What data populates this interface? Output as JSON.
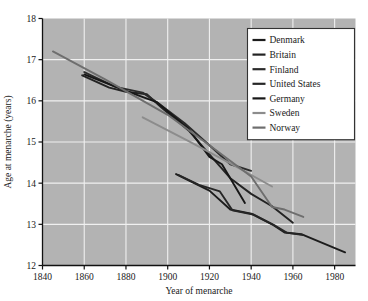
{
  "chart_data": {
    "type": "line",
    "title": "",
    "xlabel": "Year of menarche",
    "ylabel": "Age at menarche (years)",
    "xlim": [
      1840,
      1990
    ],
    "ylim": [
      12,
      18
    ],
    "xticks": [
      1840,
      1860,
      1880,
      1900,
      1920,
      1940,
      1960,
      1980
    ],
    "yticks": [
      12,
      13,
      14,
      15,
      16,
      17,
      18
    ],
    "grid": true,
    "legend_position": "top-right",
    "background_color": "#b3b3b3",
    "grid_color": "#f0f0f0",
    "series": [
      {
        "name": "Denmark",
        "color": "#1c1c1c",
        "points": [
          [
            1904,
            14.22
          ],
          [
            1912,
            14.02
          ],
          [
            1920,
            13.82
          ],
          [
            1930,
            13.36
          ],
          [
            1940,
            13.26
          ],
          [
            1950,
            13.0
          ],
          [
            1956,
            12.8
          ],
          [
            1964,
            12.76
          ],
          [
            1985,
            12.32
          ]
        ]
      },
      {
        "name": "Britain",
        "color": "#232323",
        "points": [
          [
            1859,
            16.62
          ],
          [
            1872,
            16.32
          ],
          [
            1880,
            16.22
          ],
          [
            1890,
            16.16
          ],
          [
            1897,
            15.84
          ],
          [
            1910,
            15.28
          ],
          [
            1920,
            14.7
          ],
          [
            1930,
            14.12
          ],
          [
            1940,
            13.74
          ],
          [
            1950,
            13.44
          ],
          [
            1960,
            13.04
          ]
        ]
      },
      {
        "name": "Finland",
        "color": "#2b2b2b",
        "points": [
          [
            1860,
            16.7
          ],
          [
            1875,
            16.34
          ],
          [
            1888,
            16.2
          ],
          [
            1896,
            15.92
          ],
          [
            1908,
            15.46
          ],
          [
            1920,
            14.92
          ],
          [
            1930,
            14.46
          ],
          [
            1940,
            14.3
          ]
        ]
      },
      {
        "name": "United States",
        "color": "#262626",
        "points": [
          [
            1905,
            14.2
          ],
          [
            1915,
            13.96
          ],
          [
            1925,
            13.8
          ],
          [
            1931,
            13.34
          ],
          [
            1941,
            13.24
          ],
          [
            1951,
            12.98
          ],
          [
            1957,
            12.8
          ],
          [
            1965,
            12.74
          ]
        ]
      },
      {
        "name": "Germany",
        "color": "#171717",
        "points": [
          [
            1860,
            16.64
          ],
          [
            1880,
            16.24
          ],
          [
            1895,
            15.96
          ],
          [
            1910,
            15.32
          ],
          [
            1920,
            14.64
          ],
          [
            1926,
            14.46
          ],
          [
            1937,
            13.52
          ]
        ]
      },
      {
        "name": "Sweden",
        "color": "#8c8c8c",
        "points": [
          [
            1888,
            15.6
          ],
          [
            1910,
            15.02
          ],
          [
            1930,
            14.48
          ],
          [
            1950,
            13.92
          ]
        ]
      },
      {
        "name": "Norway",
        "color": "#6e6e6e",
        "points": [
          [
            1845,
            17.2
          ],
          [
            1870,
            16.52
          ],
          [
            1900,
            15.66
          ],
          [
            1920,
            14.92
          ],
          [
            1940,
            14.16
          ],
          [
            1950,
            13.42
          ],
          [
            1956,
            13.36
          ],
          [
            1965,
            13.18
          ]
        ]
      }
    ]
  },
  "legend": {
    "items": [
      {
        "label": "Denmark"
      },
      {
        "label": "Britain"
      },
      {
        "label": "Finland"
      },
      {
        "label": "United States"
      },
      {
        "label": "Germany"
      },
      {
        "label": "Sweden"
      },
      {
        "label": "Norway"
      }
    ]
  }
}
